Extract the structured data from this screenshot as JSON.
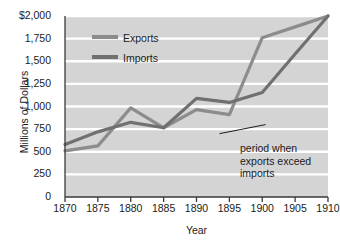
{
  "chart_data": {
    "type": "line",
    "title": "",
    "xlabel": "Year",
    "ylabel": "Millions of Dollars",
    "x": [
      1870,
      1875,
      1880,
      1885,
      1890,
      1895,
      1900,
      1905,
      1910
    ],
    "xlim": [
      1870,
      1910
    ],
    "ylim": [
      0,
      2000
    ],
    "grid": true,
    "legend_position": "upper-left-inside",
    "ytick_labels": [
      "$2,000",
      "1,750",
      "1,500",
      "1,250",
      "1,000",
      "750",
      "500",
      "250",
      "0"
    ],
    "ytick_values": [
      2000,
      1750,
      1500,
      1250,
      1000,
      750,
      500,
      250,
      0
    ],
    "xtick_labels": [
      "1870",
      "1875",
      "1880",
      "1885",
      "1890",
      "1895",
      "1900",
      "1905",
      "1910"
    ],
    "series": [
      {
        "name": "Exports",
        "color": "#8c8c8c",
        "values": [
          510,
          565,
          985,
          765,
          965,
          910,
          1760,
          1880,
          2000
        ]
      },
      {
        "name": "Imports",
        "color": "#707070",
        "values": [
          580,
          720,
          825,
          765,
          1090,
          1045,
          1155,
          1580,
          2000
        ]
      }
    ],
    "annotations": [
      {
        "text_lines": [
          "period when",
          "exports exceed",
          "imports"
        ],
        "leader_from_x": 1893.5,
        "leader_from_y": 700,
        "leader_to_x": 1900.5,
        "leader_to_y": 800
      }
    ]
  },
  "legend": {
    "items": [
      {
        "label": "Exports"
      },
      {
        "label": "Imports"
      }
    ]
  },
  "style": {
    "plot_background": "#d4d4d4",
    "gridline_color": "#ffffff",
    "axis_color": "#3a3a3a",
    "text_color": "#1b1b1b"
  }
}
